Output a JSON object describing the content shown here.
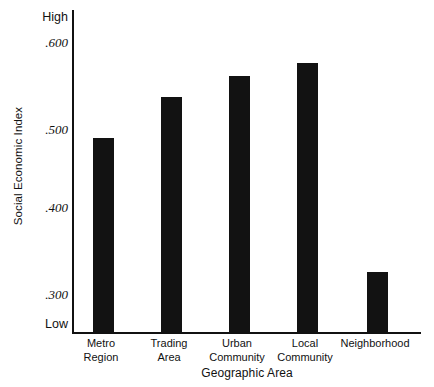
{
  "chart_data": {
    "type": "bar",
    "title": "",
    "xlabel": "Geographic Area",
    "ylabel": "Social Economic Index",
    "categories": [
      "Metro Region",
      "Trading Area",
      "Urban Community",
      "Local Community",
      "Neighborhood"
    ],
    "values": [
      0.482,
      0.528,
      0.551,
      0.566,
      0.332
    ],
    "ylim": [
      0.265,
      0.625
    ],
    "grid": false,
    "legend": null,
    "bar_color": "#121212",
    "axis_color": "#111111",
    "y_axis": {
      "low_label": "Low",
      "high_label": "High",
      "ticks": [
        {
          "label": ".300",
          "value": 0.3
        },
        {
          "label": ".400",
          "value": 0.4
        },
        {
          "label": ".500",
          "value": 0.5
        },
        {
          "label": ".600",
          "value": 0.6
        }
      ]
    },
    "bars": [
      {
        "category_line1": "Metro",
        "category_line2": "Region",
        "value": 0.482
      },
      {
        "category_line1": "Trading",
        "category_line2": "Area",
        "value": 0.528
      },
      {
        "category_line1": "Urban",
        "category_line2": "Community",
        "value": 0.551
      },
      {
        "category_line1": "Local",
        "category_line2": "Community",
        "value": 0.566
      },
      {
        "category_line1": "Neighborhood",
        "category_line2": "",
        "value": 0.332
      }
    ]
  }
}
